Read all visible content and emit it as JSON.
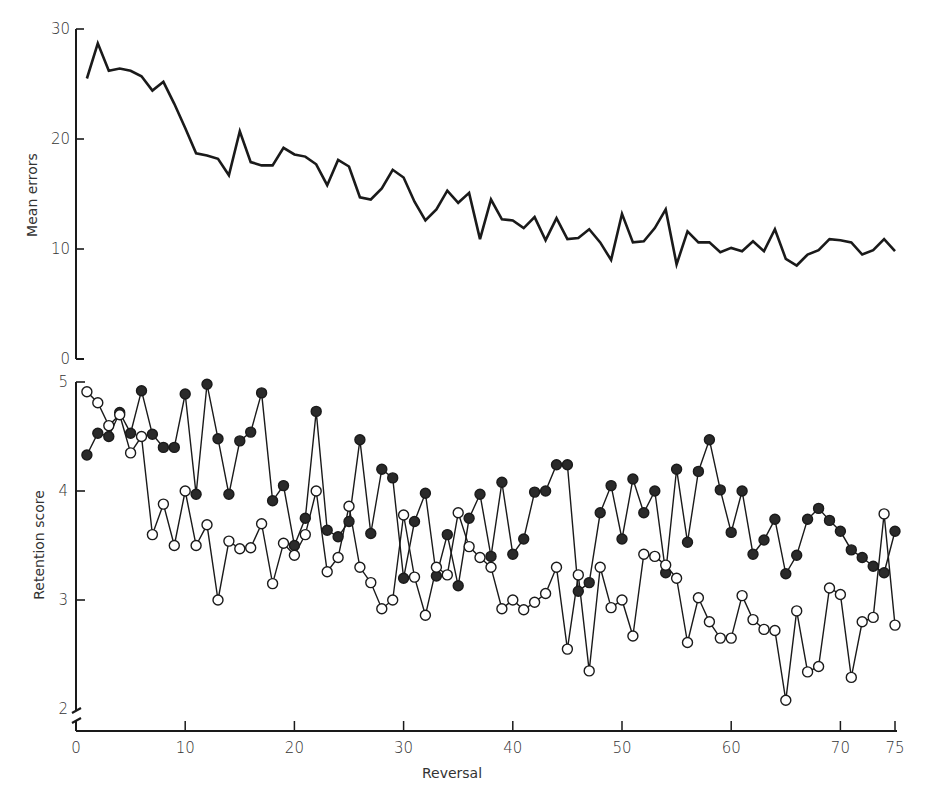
{
  "chart_data": [
    {
      "type": "line",
      "panel": "top",
      "title": "",
      "xlabel": "",
      "ylabel": "Mean errors",
      "ylim": [
        0,
        30
      ],
      "yticks": [
        0,
        10,
        20,
        30
      ],
      "xlim": [
        0,
        75
      ],
      "grid": false,
      "x": [
        1,
        2,
        3,
        4,
        5,
        6,
        7,
        8,
        9,
        10,
        11,
        12,
        13,
        14,
        15,
        16,
        17,
        18,
        19,
        20,
        21,
        22,
        23,
        24,
        25,
        26,
        27,
        28,
        29,
        30,
        31,
        32,
        33,
        34,
        35,
        36,
        37,
        38,
        39,
        40,
        41,
        42,
        43,
        44,
        45,
        46,
        47,
        48,
        49,
        50,
        51,
        52,
        53,
        54,
        55,
        56,
        57,
        58,
        59,
        60,
        61,
        62,
        63,
        64,
        65,
        66,
        67,
        68,
        69,
        70,
        71,
        72,
        73,
        74,
        75
      ],
      "series": [
        {
          "name": "Mean errors",
          "marker": "none",
          "values": [
            25.5,
            28.7,
            26.2,
            26.4,
            26.2,
            25.7,
            24.4,
            25.2,
            23.2,
            21.0,
            18.7,
            18.5,
            18.2,
            16.7,
            20.7,
            17.9,
            17.6,
            17.6,
            19.2,
            18.6,
            18.4,
            17.7,
            15.8,
            18.1,
            17.5,
            14.7,
            14.5,
            15.5,
            17.2,
            16.5,
            14.3,
            12.6,
            13.6,
            15.3,
            14.2,
            15.1,
            10.9,
            14.5,
            12.7,
            12.6,
            11.9,
            12.9,
            10.8,
            12.8,
            10.9,
            11.0,
            11.8,
            10.6,
            9.0,
            13.2,
            10.6,
            10.7,
            11.9,
            13.6,
            8.6,
            11.6,
            10.6,
            10.6,
            9.7,
            10.1,
            9.8,
            10.7,
            9.8,
            11.8,
            9.1,
            8.5,
            9.5,
            9.9,
            10.9,
            10.8,
            10.6,
            9.5,
            9.9,
            10.9,
            9.8
          ]
        }
      ]
    },
    {
      "type": "line",
      "panel": "bottom",
      "title": "",
      "xlabel": "Reversal",
      "ylabel": "Retention score",
      "ylim": [
        2,
        5
      ],
      "yticks": [
        2,
        3,
        4,
        5
      ],
      "y_axis_break": true,
      "xlim": [
        0,
        75
      ],
      "xticks": [
        0,
        10,
        20,
        30,
        40,
        50,
        60,
        70,
        75
      ],
      "grid": false,
      "x": [
        1,
        2,
        3,
        4,
        5,
        6,
        7,
        8,
        9,
        10,
        11,
        12,
        13,
        14,
        15,
        16,
        17,
        18,
        19,
        20,
        21,
        22,
        23,
        24,
        25,
        26,
        27,
        28,
        29,
        30,
        31,
        32,
        33,
        34,
        35,
        36,
        37,
        38,
        39,
        40,
        41,
        42,
        43,
        44,
        45,
        46,
        47,
        48,
        49,
        50,
        51,
        52,
        53,
        54,
        55,
        56,
        57,
        58,
        59,
        60,
        61,
        62,
        63,
        64,
        65,
        66,
        67,
        68,
        69,
        70,
        71,
        72,
        73,
        74,
        75
      ],
      "series": [
        {
          "name": "Filled circles",
          "marker": "filled-circle",
          "values": [
            4.33,
            4.53,
            4.5,
            4.72,
            4.53,
            4.92,
            4.52,
            4.4,
            4.4,
            4.89,
            3.97,
            4.98,
            4.48,
            3.97,
            4.46,
            4.54,
            4.9,
            3.91,
            4.05,
            3.5,
            3.75,
            4.73,
            3.64,
            3.58,
            3.72,
            4.47,
            3.61,
            4.2,
            4.12,
            3.2,
            3.72,
            3.98,
            3.22,
            3.6,
            3.13,
            3.75,
            3.97,
            3.4,
            4.08,
            3.42,
            3.56,
            3.99,
            4.0,
            4.24,
            4.24,
            3.08,
            3.16,
            3.8,
            4.05,
            3.56,
            4.11,
            3.8,
            4.0,
            3.25,
            4.2,
            3.53,
            4.18,
            4.47,
            4.01,
            3.62,
            4.0,
            3.42,
            3.55,
            3.74,
            3.24,
            3.41,
            3.74,
            3.84,
            3.73,
            3.63,
            3.46,
            3.39,
            3.31,
            3.25,
            3.63
          ]
        },
        {
          "name": "Open circles",
          "marker": "open-circle",
          "values": [
            4.91,
            4.81,
            4.6,
            4.7,
            4.35,
            4.5,
            3.6,
            3.88,
            3.5,
            4.0,
            3.5,
            3.69,
            3.0,
            3.54,
            3.47,
            3.48,
            3.7,
            3.15,
            3.52,
            3.41,
            3.6,
            4.0,
            3.26,
            3.39,
            3.86,
            3.3,
            3.16,
            2.92,
            3.0,
            3.78,
            3.21,
            2.86,
            3.3,
            3.23,
            3.8,
            3.49,
            3.39,
            3.3,
            2.92,
            3.0,
            2.91,
            2.98,
            3.06,
            3.3,
            2.55,
            3.23,
            2.35,
            3.3,
            2.93,
            3.0,
            2.67,
            3.42,
            3.4,
            3.32,
            3.2,
            2.61,
            3.02,
            2.8,
            2.65,
            2.65,
            3.04,
            2.82,
            2.73,
            2.72,
            2.08,
            2.9,
            2.34,
            2.39,
            3.11,
            3.05,
            2.29,
            2.8,
            2.84,
            3.79,
            2.77
          ]
        }
      ]
    }
  ],
  "axes": {
    "top_y_ticks": [
      "0",
      "10",
      "20",
      "30"
    ],
    "bottom_y_ticks": [
      "2",
      "3",
      "4",
      "5"
    ],
    "x_ticks": [
      "0",
      "10",
      "20",
      "30",
      "40",
      "50",
      "60",
      "70",
      "75"
    ],
    "top_ylabel": "Mean errors",
    "bottom_ylabel": "Retention score",
    "xlabel": "Reversal"
  },
  "colors": {
    "ink": "#1a1a1a",
    "background": "#ffffff",
    "open_fill": "#ffffff",
    "filled_fill": "#2a2a2a"
  }
}
